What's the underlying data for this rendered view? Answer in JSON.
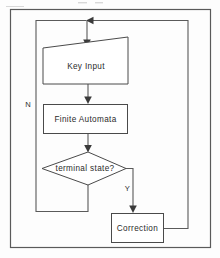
{
  "diagram": {
    "type": "flowchart",
    "title": "",
    "background_color": "#fdfdfd",
    "line_color": "#5a5a5a",
    "text_color": "#2b2b2b",
    "nodes": [
      {
        "id": "key_input",
        "label": "Key Input",
        "shape": "slanted-top-rectangle"
      },
      {
        "id": "finite_automata",
        "label": "Finite Automata",
        "shape": "rectangle"
      },
      {
        "id": "terminal_state",
        "label": "terminal state?",
        "shape": "diamond"
      },
      {
        "id": "correction",
        "label": "Correction",
        "shape": "rectangle"
      }
    ],
    "edges": [
      {
        "id": "edge-key-input-to-finite-automata",
        "from": "key_input",
        "to": "finite_automata",
        "label": ""
      },
      {
        "id": "edge-finite-automata-to-terminal-state",
        "from": "finite_automata",
        "to": "terminal_state",
        "label": ""
      },
      {
        "id": "edge-terminal-state-no-loop",
        "from": "terminal_state",
        "to": "key_input",
        "label": "N"
      },
      {
        "id": "edge-terminal-state-yes-to-correction",
        "from": "terminal_state",
        "to": "correction",
        "label": "Y"
      },
      {
        "id": "edge-correction-to-key-input",
        "from": "correction",
        "to": "key_input",
        "label": ""
      }
    ],
    "branch_labels": {
      "no": "N",
      "yes": "Y"
    }
  }
}
